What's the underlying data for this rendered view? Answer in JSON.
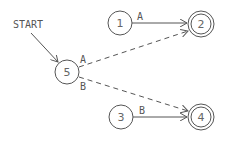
{
  "diagram": {
    "type": "finite-state-automaton",
    "start_label": "START",
    "start_state": "5",
    "colors": {
      "stroke": "#555555",
      "text": "#555555",
      "background": "#ffffff"
    },
    "states": [
      {
        "id": "1",
        "label": "1",
        "accepting": false
      },
      {
        "id": "2",
        "label": "2",
        "accepting": true
      },
      {
        "id": "3",
        "label": "3",
        "accepting": false
      },
      {
        "id": "4",
        "label": "4",
        "accepting": true
      },
      {
        "id": "5",
        "label": "5",
        "accepting": false
      }
    ],
    "transitions": [
      {
        "from": "1",
        "to": "2",
        "label": "A",
        "style": "solid"
      },
      {
        "from": "5",
        "to": "2",
        "label": "A",
        "style": "dashed"
      },
      {
        "from": "5",
        "to": "4",
        "label": "B",
        "style": "dashed"
      },
      {
        "from": "3",
        "to": "4",
        "label": "B",
        "style": "solid"
      }
    ]
  }
}
